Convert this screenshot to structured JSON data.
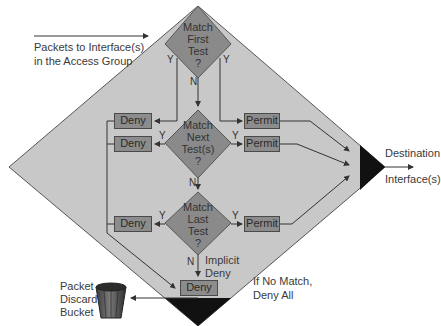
{
  "diagram": {
    "colors": {
      "background": "#ffffff",
      "big_diamond_fill": "#c8c8c8",
      "decision_fill": "#8a8a8a",
      "box_fill": "#8c8c8c",
      "stroke": "#444444",
      "corner_fill": "#111111"
    },
    "input_label": [
      "Packets to Interface(s)",
      "in the Access Group"
    ],
    "decisions": [
      {
        "id": "first",
        "lines": [
          "Match",
          "First",
          "Test",
          "?"
        ],
        "yes_left": "Y",
        "yes_right": "Y",
        "no": "N"
      },
      {
        "id": "next",
        "lines": [
          "Match",
          "Next",
          "Test(s)",
          "?"
        ],
        "yes_left": "Y",
        "yes_right": "Y",
        "no": "N"
      },
      {
        "id": "last",
        "lines": [
          "Match",
          "Last",
          "Test",
          "?"
        ],
        "yes_left": "Y",
        "yes_right": "Y",
        "no": "N"
      }
    ],
    "deny_boxes": [
      "Deny",
      "Deny",
      "Deny",
      "Deny"
    ],
    "permit_boxes": [
      "Permit",
      "Permit",
      "Permit"
    ],
    "implicit_deny": [
      "Implicit",
      "Deny"
    ],
    "no_match_label": [
      "If No Match,",
      "Deny All"
    ],
    "destination_label": [
      "Destination",
      "Interface(s)"
    ],
    "discard_label": [
      "Packet",
      "Discard",
      "Bucket"
    ]
  }
}
